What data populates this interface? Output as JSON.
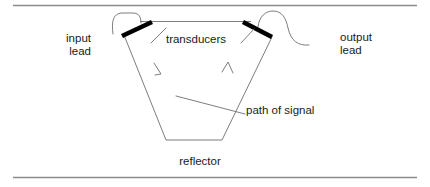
{
  "figure": {
    "kind": "line-diagram",
    "title": "",
    "background_color": "#ffffff",
    "stroke_color": "#3a3a3a",
    "bold_stroke_color": "#000000",
    "rule_color": "#8a8a8a",
    "labels": {
      "input_lead": "input\nlead",
      "transducers": "transducers",
      "output_lead": "output\nlead",
      "path_of_signal": "path of signal",
      "reflector": "reflector"
    },
    "rules": {
      "top": "horizontal rule",
      "bottom": "horizontal rule"
    },
    "parts": {
      "left_transducer": "left-transducer-bar",
      "right_transducer": "right-transducer-bar",
      "input_lead_wire": "input-lead-wire",
      "output_lead_wire": "output-lead-wire",
      "signal_path": "signal-path-trapezoid",
      "reflector_surface": "reflector-bottom-edge"
    }
  }
}
